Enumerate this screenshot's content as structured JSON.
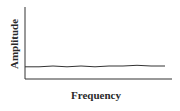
{
  "chart_data": {
    "type": "line",
    "title": "",
    "xlabel": "Frequency",
    "ylabel": "Amplitude",
    "grid": false,
    "legend": null,
    "x_ticks": [],
    "y_ticks": [],
    "series": [
      {
        "name": "signal",
        "x": [
          0,
          0.1,
          0.2,
          0.3,
          0.4,
          0.5,
          0.6,
          0.7,
          0.8,
          0.9,
          1.0
        ],
        "values": [
          0.17,
          0.17,
          0.18,
          0.17,
          0.18,
          0.17,
          0.18,
          0.18,
          0.19,
          0.18,
          0.18
        ]
      }
    ],
    "xlim": [
      0,
      1.05
    ],
    "ylim": [
      0,
      1
    ]
  },
  "colors": {
    "axis": "#333333",
    "line": "#333333"
  }
}
